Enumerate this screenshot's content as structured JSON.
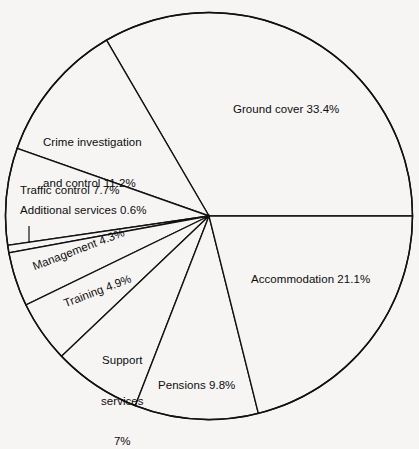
{
  "chart_data": {
    "type": "pie",
    "title": "",
    "subtitle": "",
    "xlabel": "",
    "ylabel": "",
    "legend_position": "none",
    "grid": false,
    "units": "percent",
    "start_angle_deg": 0,
    "direction": "counterclockwise",
    "categories": [
      "Ground cover",
      "Crime investigation and control",
      "Traffic control",
      "Additional services",
      "Management",
      "Training",
      "Support services",
      "Pensions",
      "Accommodation"
    ],
    "values": [
      33.4,
      11.2,
      7.7,
      0.6,
      4.3,
      4.9,
      7.0,
      9.8,
      21.1
    ],
    "labels": [
      "Ground cover 33.4%",
      "Crime investigation\nand control 11.2%",
      "Traffic control 7.7%",
      "Additional services 0.6%",
      "Management 4.3%",
      "Training 4.9%",
      "Support\nservices\n7%",
      "Pensions 9.8%",
      "Accommodation 21.1%"
    ],
    "slice_fill": "#f6f5f3",
    "slice_stroke": "#111111",
    "background": "#f6f5f3"
  },
  "labels": {
    "ground_cover": "Ground cover 33.4%",
    "crime_line1": "Crime investigation",
    "crime_line2": "and control 11.2%",
    "traffic_control": "Traffic control 7.7%",
    "additional_services": "Additional services 0.6%",
    "management": "Management 4.3%",
    "training": "Training 4.9%",
    "support_line1": "Support",
    "support_line2": "services",
    "support_line3": "7%",
    "pensions": "Pensions 9.8%",
    "accommodation": "Accommodation 21.1%"
  }
}
